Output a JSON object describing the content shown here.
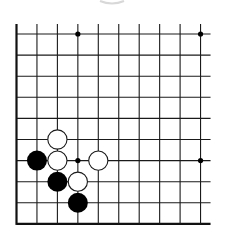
{
  "board": {
    "cols": 10,
    "rows": 10,
    "origin_x": 16.5,
    "origin_y": 34,
    "spacing_x": 20.45,
    "spacing_y": 21.1,
    "open_top_extend": 10,
    "open_right_extend": 10,
    "open_left_extend": 0,
    "line_color": "#1a1a1a",
    "edge_color": "#111111"
  },
  "star_points": [
    {
      "col": 3,
      "row": 0
    },
    {
      "col": 9,
      "row": 0
    },
    {
      "col": 3,
      "row": 6
    },
    {
      "col": 9,
      "row": 6
    }
  ],
  "stones": [
    {
      "color": "white",
      "col": 2,
      "row": 5
    },
    {
      "color": "black",
      "col": 1,
      "row": 6
    },
    {
      "color": "white",
      "col": 2,
      "row": 6
    },
    {
      "color": "white",
      "col": 4,
      "row": 6
    },
    {
      "color": "black",
      "col": 2,
      "row": 7
    },
    {
      "color": "white",
      "col": 3,
      "row": 7
    },
    {
      "color": "black",
      "col": 3,
      "row": 8
    }
  ],
  "colors": {
    "black_stone": "#000000",
    "white_stone_fill": "#ffffff",
    "white_stone_stroke": "#1a1a1a",
    "top_arc": "#d8d8d8"
  }
}
